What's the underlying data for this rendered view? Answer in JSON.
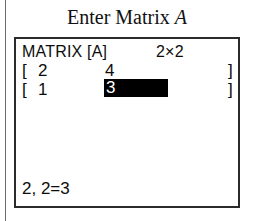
{
  "caption": {
    "prefix": "Enter Matrix",
    "variable": "A"
  },
  "screen": {
    "header": {
      "title": "MATRIX [A]",
      "dimensions": "2×2"
    },
    "brackets": {
      "open": "[",
      "close": "]"
    },
    "matrix": {
      "rows": [
        {
          "cells": [
            "2",
            "4"
          ]
        },
        {
          "cells": [
            "1",
            "3"
          ]
        }
      ],
      "selected_row": 1,
      "selected_col": 1
    },
    "status": "2, 2=3"
  },
  "colors": {
    "ink": "#0c0c0c",
    "frame": "#2b2b2b",
    "highlight_bg": "#000000",
    "highlight_fg": "#ffffff",
    "page_rule": "#6e6e6e",
    "background": "#ffffff"
  }
}
